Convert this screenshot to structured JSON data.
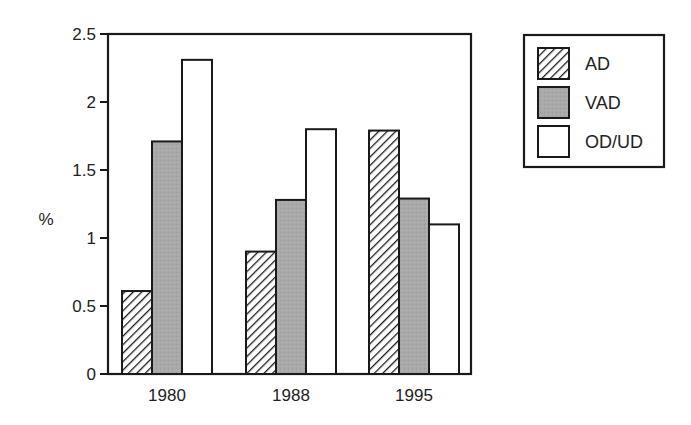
{
  "chart_data": {
    "type": "bar",
    "title": "",
    "xlabel": "",
    "ylabel": "%",
    "ylim": [
      0,
      2.5
    ],
    "yticks": [
      0,
      0.5,
      1,
      1.5,
      2,
      2.5
    ],
    "ytick_labels": [
      "0",
      "0.5",
      "1",
      "1.5",
      "2",
      "2.5"
    ],
    "grid": false,
    "legend_position": "right-top, outside plot",
    "categories": [
      "1980",
      "1988",
      "1995"
    ],
    "series": [
      {
        "name": "AD",
        "fill": "hatch",
        "values": [
          0.61,
          0.9,
          1.79
        ]
      },
      {
        "name": "VAD",
        "fill": "gray",
        "values": [
          1.71,
          1.28,
          1.29
        ]
      },
      {
        "name": "OD/UD",
        "fill": "white",
        "values": [
          2.31,
          1.8,
          1.1
        ]
      }
    ]
  },
  "colors": {
    "axis": "#1a1a1a",
    "vad_fill": "#a9a9a9",
    "open_fill": "#ffffff",
    "hatch": "#1a1a1a"
  }
}
